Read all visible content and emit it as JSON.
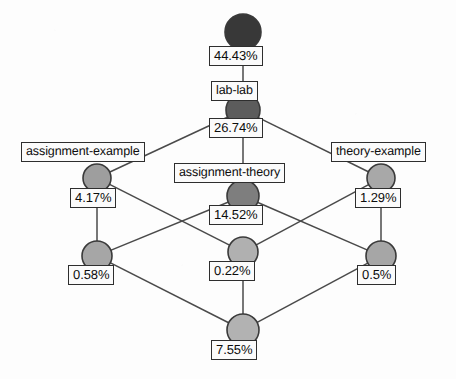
{
  "diagram": {
    "type": "concept-lattice",
    "title": "",
    "nodes": [
      {
        "id": "n0",
        "support": "44.43%",
        "attribute": "",
        "fill": "#383838",
        "cx": 243,
        "cy": 32,
        "r": 18
      },
      {
        "id": "n1",
        "support": "26.74%",
        "attribute": "lab-lab",
        "fill": "#5c5c5c",
        "cx": 243,
        "cy": 110,
        "r": 17
      },
      {
        "id": "n2",
        "support": "4.17%",
        "attribute": "assignment-example",
        "fill": "#9e9e9e",
        "cx": 97,
        "cy": 178,
        "r": 14
      },
      {
        "id": "n3",
        "support": "14.52%",
        "attribute": "assignment-theory",
        "fill": "#7e7e7e",
        "cx": 243,
        "cy": 196,
        "r": 16
      },
      {
        "id": "n4",
        "support": "1.29%",
        "attribute": "theory-example",
        "fill": "#a8a8a8",
        "cx": 381,
        "cy": 178,
        "r": 14
      },
      {
        "id": "n5",
        "support": "0.58%",
        "attribute": "",
        "fill": "#a6a6a6",
        "cx": 97,
        "cy": 256,
        "r": 15
      },
      {
        "id": "n6",
        "support": "0.22%",
        "attribute": "",
        "fill": "#b0b0b0",
        "cx": 243,
        "cy": 252,
        "r": 15
      },
      {
        "id": "n7",
        "support": "0.5%",
        "attribute": "",
        "fill": "#a6a6a6",
        "cx": 381,
        "cy": 256,
        "r": 15
      },
      {
        "id": "n8",
        "support": "7.55%",
        "attribute": "",
        "fill": "#b2b2b2",
        "cx": 243,
        "cy": 330,
        "r": 16
      }
    ],
    "edges": [
      {
        "from": "n0",
        "to": "n1"
      },
      {
        "from": "n1",
        "to": "n2"
      },
      {
        "from": "n1",
        "to": "n3"
      },
      {
        "from": "n1",
        "to": "n4"
      },
      {
        "from": "n2",
        "to": "n5"
      },
      {
        "from": "n2",
        "to": "n6"
      },
      {
        "from": "n3",
        "to": "n5"
      },
      {
        "from": "n3",
        "to": "n7"
      },
      {
        "from": "n4",
        "to": "n6"
      },
      {
        "from": "n4",
        "to": "n7"
      },
      {
        "from": "n5",
        "to": "n8"
      },
      {
        "from": "n6",
        "to": "n8"
      },
      {
        "from": "n7",
        "to": "n8"
      }
    ],
    "support_labels": [
      {
        "text": "44.43%",
        "left": 209,
        "top": 46
      },
      {
        "text": "26.74%",
        "left": 209,
        "top": 118
      },
      {
        "text": "4.17%",
        "left": 70,
        "top": 188
      },
      {
        "text": "14.52%",
        "left": 209,
        "top": 205
      },
      {
        "text": "1.29%",
        "left": 355,
        "top": 188
      },
      {
        "text": "0.58%",
        "left": 68,
        "top": 265
      },
      {
        "text": "0.22%",
        "left": 209,
        "top": 261
      },
      {
        "text": "0.5%",
        "left": 357,
        "top": 265
      },
      {
        "text": "7.55%",
        "left": 211,
        "top": 340
      }
    ],
    "attribute_labels": [
      {
        "text": "lab-lab",
        "left": 211,
        "top": 81
      },
      {
        "text": "assignment-example",
        "left": 21,
        "top": 142
      },
      {
        "text": "assignment-theory",
        "left": 174,
        "top": 163
      },
      {
        "text": "theory-example",
        "left": 331,
        "top": 142
      }
    ],
    "colors": {
      "node_stroke": "#3a3a3a",
      "edge": "#4a4a4a",
      "box_border": "#2e2e2e",
      "box_fill": "#fbfbfb",
      "text": "#0d0d0d",
      "background": "#fdfdfd"
    }
  }
}
